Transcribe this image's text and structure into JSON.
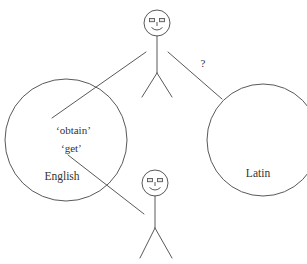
{
  "diagram": {
    "stroke_color": "#595959",
    "text_color": "#333333",
    "background_color": "#ffffff",
    "circles": [
      {
        "id": "english-circle",
        "label": "English",
        "cx": 66,
        "cy": 140,
        "r": 61
      },
      {
        "id": "latin-circle",
        "label": "Latin",
        "cx": 263,
        "cy": 140,
        "r": 56
      }
    ],
    "english_terms": [
      {
        "text": "‘obtain’",
        "x": 56,
        "y": 134
      },
      {
        "text": "‘get’",
        "x": 54,
        "y": 152
      }
    ],
    "labels": {
      "english": "English",
      "latin": "Latin",
      "question_mark": "?"
    },
    "figures": [
      {
        "id": "speaker-top",
        "head_cx": 157,
        "head_cy": 23,
        "head_r": 13
      },
      {
        "id": "speaker-bottom",
        "head_cx": 155,
        "head_cy": 183,
        "head_r": 13
      }
    ],
    "connectors": [
      {
        "id": "top-figure-to-english",
        "from": "speaker-top-left-arm",
        "to": "english-circle"
      },
      {
        "id": "top-figure-to-latin",
        "from": "speaker-top-right-arm",
        "to": "latin-circle",
        "annotation": "?"
      },
      {
        "id": "bottom-figure-to-english",
        "from": "speaker-bottom-left-arm",
        "to": "english-circle"
      }
    ]
  }
}
